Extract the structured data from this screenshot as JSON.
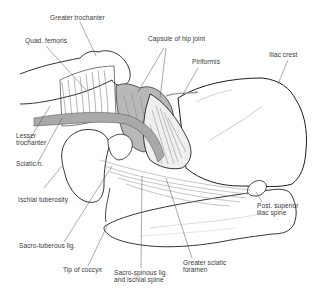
{
  "diagram": {
    "colors": {
      "background": "#ffffff",
      "outline": "#1e1e1e",
      "leader_line": "#444444",
      "sciatic_nerve": "#a9a9a9",
      "capsule_shade": "#b8b8b8",
      "label_text": "#3a3a3a"
    },
    "labels": {
      "greater_trochanter": "Greater trochanter",
      "quad_femoris": "Quad. femoris",
      "capsule_of_hip_joint": "Capsule of hip joint",
      "piriformis": "Piriformis",
      "iliac_crest": "Iliac crest",
      "lesser_trochanter": "Lesser\ntrochanter",
      "sciatic_n": "Sciatic n.",
      "ischial_tuberosity": "Ischial tuberosity",
      "sacro_tuberous_lig": "Sacro-tuberous lig.",
      "tip_of_coccyx": "Tip of coccyx",
      "sacro_spinous_lig": "Sacro-spinous lig.\nand ischial spine",
      "greater_sciatic_foramen": "Greater sciatic\nforamen",
      "post_superior_iliac_spine": "Post. superior\niliac spine"
    }
  }
}
